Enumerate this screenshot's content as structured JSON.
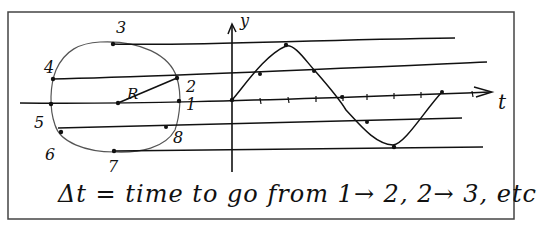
{
  "diagram": {
    "circle": {
      "radius_label": "R",
      "point_labels": [
        "1",
        "2",
        "3",
        "4",
        "5",
        "6",
        "7",
        "8"
      ]
    },
    "graph": {
      "y_axis_label": "y",
      "x_axis_label": "t"
    },
    "caption": "Δt = time to go from 1→ 2, 2→ 3, etc",
    "colors": {
      "ink": "#111111",
      "frame": "#444444",
      "background": "#ffffff"
    }
  }
}
